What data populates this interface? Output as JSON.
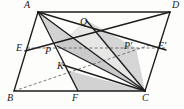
{
  "figure": {
    "kind": "geometry-diagram",
    "width": 184,
    "height": 109,
    "background_color": "#fdfdfc",
    "stroke_color": "#1d1d1d",
    "dashed_stroke_color": "#4a4a4a",
    "shade_fill_color": "#b9b9b9",
    "shade_fill_opacity": "0.55"
  },
  "vertices": {
    "A": {
      "label": "A",
      "x": 38,
      "y": 12,
      "label_x": 24,
      "label_y": 1
    },
    "B": {
      "label": "B",
      "x": 14,
      "y": 91,
      "label_x": 8,
      "label_y": 93
    },
    "C": {
      "label": "C",
      "x": 145,
      "y": 91,
      "label_x": 142,
      "label_y": 93
    },
    "D": {
      "label": "D",
      "x": 170,
      "y": 12,
      "label_x": 172,
      "label_y": 1
    },
    "E": {
      "label": "E",
      "x": 27,
      "y": 48,
      "label_x": 17,
      "label_y": 43
    },
    "Eprime": {
      "label": "E'",
      "x": 157,
      "y": 48,
      "label_x": 157,
      "label_y": 42
    },
    "P": {
      "label": "P",
      "x": 57,
      "y": 46,
      "label_x": 46,
      "label_y": 46
    },
    "Pprime": {
      "label": "P'",
      "x": 136,
      "y": 48,
      "label_x": 124,
      "label_y": 42
    },
    "Q": {
      "label": "Q",
      "x": 86,
      "y": 20,
      "label_x": 81,
      "label_y": 17
    },
    "K": {
      "label": "K",
      "x": 66,
      "y": 70,
      "label_x": 57,
      "label_y": 62
    },
    "F": {
      "label": "F",
      "x": 78,
      "y": 91,
      "label_x": 73,
      "label_y": 93
    }
  },
  "segments": [
    {
      "name": "side-AB",
      "from": "A",
      "to": "B",
      "style": "solid"
    },
    {
      "name": "side-BC",
      "from": "B",
      "to": "C",
      "style": "solid"
    },
    {
      "name": "side-CD",
      "from": "C",
      "to": "D",
      "style": "solid"
    },
    {
      "name": "side-DA",
      "from": "D",
      "to": "A",
      "style": "solid"
    },
    {
      "name": "diagonal-AC",
      "from": "A",
      "to": "C",
      "style": "solid"
    },
    {
      "name": "segment-E-Eprime",
      "from": "E",
      "to": "Eprime",
      "style": "dashed"
    },
    {
      "name": "segment-B-Pprime",
      "from": "B",
      "to": "Pprime",
      "style": "dashed"
    },
    {
      "name": "segment-E-D",
      "from": "E",
      "to": "D",
      "style": "solid"
    },
    {
      "name": "segment-A-F",
      "from": "A",
      "to": "F",
      "style": "solid"
    },
    {
      "name": "segment-A-C-lower",
      "from": "A",
      "to": "C",
      "style": "solid"
    },
    {
      "name": "segment-P-C",
      "from": "P",
      "to": "C",
      "style": "solid"
    },
    {
      "name": "segment-Q-C",
      "from": "Q",
      "to": "C",
      "style": "solid"
    },
    {
      "name": "segment-K-C",
      "from": "K",
      "to": "C",
      "style": "solid"
    },
    {
      "name": "segment-F-C-shade-edge",
      "from": "F",
      "to": "C",
      "style": "solid"
    }
  ],
  "shaded_regions": [
    {
      "name": "shaded-triangle-A-P-C",
      "points": "A,P,C"
    },
    {
      "name": "shaded-triangle-Q-Pprime-C",
      "points": "Q,Pprime,C"
    },
    {
      "name": "shaded-triangle-K-F-C",
      "points": "K,F,C"
    }
  ]
}
